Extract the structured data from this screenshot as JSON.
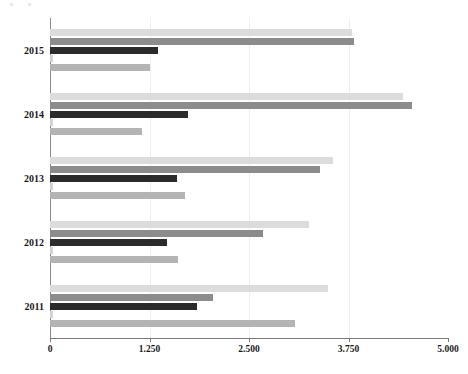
{
  "chart_data": {
    "type": "bar",
    "orientation": "horizontal",
    "title": "",
    "subtitle": "",
    "xlabel": "",
    "ylabel": "",
    "categories": [
      "2015",
      "2014",
      "2013",
      "2012",
      "2011"
    ],
    "xlim": [
      0,
      5
    ],
    "xticks": [
      0,
      1.25,
      2.5,
      3.75,
      5
    ],
    "xtick_labels": [
      "0",
      "1.250",
      "2.500",
      "3.750",
      "5.000"
    ],
    "grid": false,
    "legend": "none",
    "series": [
      {
        "name": "series-1",
        "color": "#dcdcdc",
        "values": [
          3.8,
          4.43,
          3.55,
          3.25,
          3.49
        ]
      },
      {
        "name": "series-2",
        "color": "#8c8c8c",
        "values": [
          3.82,
          4.55,
          3.39,
          2.68,
          2.05
        ]
      },
      {
        "name": "series-3",
        "color": "#2b2b2b",
        "values": [
          1.36,
          1.73,
          1.59,
          1.47,
          1.85
        ]
      },
      {
        "name": "series-4",
        "color": "#d2d2d2",
        "values": [
          0.04,
          0.04,
          0.04,
          0.04,
          0.04
        ]
      },
      {
        "name": "series-5",
        "color": "#b4b4b4",
        "values": [
          1.26,
          1.16,
          1.7,
          1.61,
          3.08
        ]
      }
    ]
  },
  "axis": {
    "x_labels": [
      "0",
      "1.250",
      "2.500",
      "3.750",
      "5.000"
    ],
    "y_labels": [
      "2015",
      "2014",
      "2013",
      "2012",
      "2011"
    ]
  },
  "colors": {
    "axis_line": "#7a7a7a",
    "tick_text": "#1a1a1a",
    "background": "#ffffff"
  }
}
